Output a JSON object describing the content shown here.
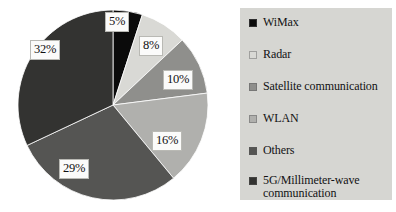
{
  "chart_data": {
    "type": "pie",
    "title": "",
    "subtitle": "",
    "xlabel": "",
    "ylabel": "",
    "grid": false,
    "legend_position": "right",
    "categories": [
      "WiMax",
      "Radar",
      "Satellite communication",
      "WLAN",
      "Others",
      "5G/Millimeter-wave communication"
    ],
    "values": [
      5,
      8,
      10,
      16,
      29,
      32
    ],
    "value_labels": [
      "5%",
      "8%",
      "10%",
      "16%",
      "29%",
      "32%"
    ],
    "units": "percent",
    "total": 100,
    "colors": [
      "#0b0b0b",
      "#d9d9d5",
      "#8f8f8c",
      "#b0b0ad",
      "#555553",
      "#333331"
    ],
    "slices": [
      {
        "name": "WiMax",
        "value": 5,
        "label": "5%",
        "color": "#0b0b0b",
        "start_angle": 0,
        "end_angle": 18
      },
      {
        "name": "Radar",
        "value": 8,
        "label": "8%",
        "color": "#d9d9d5",
        "start_angle": 18,
        "end_angle": 46.8
      },
      {
        "name": "Satellite communication",
        "value": 10,
        "label": "10%",
        "color": "#8f8f8c",
        "start_angle": 46.8,
        "end_angle": 82.8
      },
      {
        "name": "WLAN",
        "value": 16,
        "label": "16%",
        "color": "#b0b0ad",
        "start_angle": 82.8,
        "end_angle": 140.4
      },
      {
        "name": "Others",
        "value": 29,
        "label": "29%",
        "color": "#555553",
        "start_angle": 140.4,
        "end_angle": 244.8
      },
      {
        "name": "5G/Millimeter-wave communication",
        "value": 32,
        "label": "32%",
        "color": "#333331",
        "start_angle": 244.8,
        "end_angle": 360
      }
    ]
  },
  "legend": {
    "background_color": "#d6d6d2",
    "items": [
      {
        "label": "WiMax",
        "color": "#0b0b0b"
      },
      {
        "label": "Radar",
        "color": "#d9d9d5"
      },
      {
        "label": "Satellite communication",
        "color": "#8f8f8c"
      },
      {
        "label": "WLAN",
        "color": "#b0b0ad"
      },
      {
        "label": "Others",
        "color": "#555553"
      },
      {
        "label": "5G/Millimeter-wave\ncommunication",
        "color": "#333331"
      }
    ]
  },
  "labels": {
    "pct_5": "5%",
    "pct_8": "8%",
    "pct_10": "10%",
    "pct_16": "16%",
    "pct_29": "29%",
    "pct_32": "32%"
  }
}
